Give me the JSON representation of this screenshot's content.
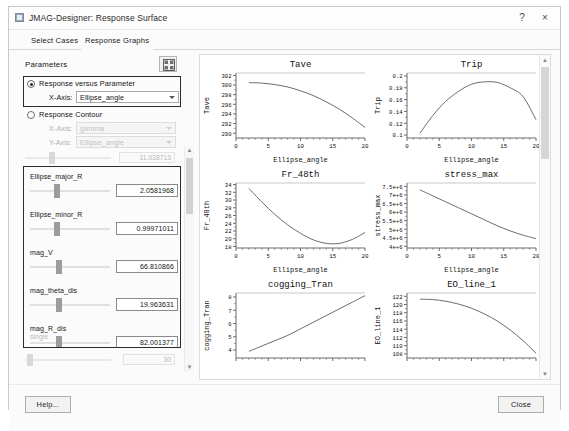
{
  "window": {
    "title": "JMAG-Designer: Response Surface",
    "help_button": "?",
    "close_button": "×"
  },
  "tabs": [
    {
      "label": "Select Cases",
      "active": false
    },
    {
      "label": "Response Graphs",
      "active": true
    }
  ],
  "left_panel": {
    "heading": "Parameters",
    "layout_button_icon": "grid-icon",
    "mode_options": [
      {
        "label": "Response versus Parameter",
        "selected": true,
        "axes": [
          {
            "label": "X-Axis:",
            "value": "Ellipse_angle",
            "enabled": true
          }
        ]
      },
      {
        "label": "Response Contour",
        "selected": false,
        "axes": [
          {
            "label": "X-Axis:",
            "value": "gamma",
            "enabled": false
          },
          {
            "label": "Y-Axis:",
            "value": "Ellipse_angle",
            "enabled": false
          }
        ]
      }
    ],
    "top_partial_slider": {
      "value": "11.038713",
      "enabled": false
    },
    "sliders": [
      {
        "name": "Ellipse_major_R",
        "value": "2.0581968",
        "thumb_pct": 30
      },
      {
        "name": "Ellipse_minor_R",
        "value": "0.99971011",
        "thumb_pct": 30
      },
      {
        "name": "mag_V",
        "value": "66.810866",
        "thumb_pct": 32
      },
      {
        "name": "mag_theta_dis",
        "value": "19.963631",
        "thumb_pct": 32
      },
      {
        "name": "mag_R_dis",
        "value": "82.001377",
        "thumb_pct": 32
      }
    ],
    "partial_slider_name": "single",
    "bottom_partial_slider": {
      "value": "30",
      "enabled": false
    },
    "scrollbar": {
      "up": "▲",
      "down": "▼"
    }
  },
  "chart_scrollbar": {
    "up": "▲",
    "down": "▼"
  },
  "footer": {
    "help_label": "Help...",
    "close_label": "Close"
  },
  "chart_data": [
    {
      "type": "line",
      "title": "Tave",
      "xlabel": "Ellipse_angle",
      "ylabel": "Tave",
      "xlim": [
        0,
        20
      ],
      "ylim": [
        289,
        302.5
      ],
      "xticks": [
        0,
        5,
        10,
        15,
        20
      ],
      "yticks": [
        290,
        292,
        294,
        296,
        298,
        300,
        302
      ],
      "grid": false,
      "x": [
        2,
        4,
        6,
        8,
        10,
        12,
        14,
        16,
        18,
        20
      ],
      "values": [
        300.5,
        300.4,
        300.1,
        299.6,
        298.8,
        297.8,
        296.5,
        295.0,
        293.2,
        291.2
      ]
    },
    {
      "type": "line",
      "title": "Trip",
      "xlabel": "Ellipse_angle",
      "ylabel": "Trip",
      "xlim": [
        0,
        20
      ],
      "ylim": [
        0.095,
        0.205
      ],
      "xticks": [
        0,
        5,
        10,
        15,
        20
      ],
      "yticks": [
        0.1,
        0.12,
        0.14,
        0.16,
        0.18,
        0.2
      ],
      "grid": false,
      "x": [
        2,
        4,
        6,
        8,
        10,
        12,
        14,
        16,
        18,
        20
      ],
      "values": [
        0.103,
        0.133,
        0.157,
        0.174,
        0.186,
        0.19,
        0.189,
        0.18,
        0.165,
        0.126
      ]
    },
    {
      "type": "line",
      "title": "Fr_48th",
      "xlabel": "Ellipse_angle",
      "ylabel": "Fr_48th",
      "xlim": [
        0,
        20
      ],
      "ylim": [
        17.6,
        34.4
      ],
      "xticks": [
        0,
        5,
        10,
        15,
        20
      ],
      "yticks": [
        18,
        20,
        22,
        24,
        26,
        28,
        30,
        32,
        34
      ],
      "grid": false,
      "x": [
        2,
        4,
        6,
        8,
        10,
        12,
        14,
        16,
        18,
        20
      ],
      "values": [
        33.0,
        29.5,
        26.3,
        23.6,
        21.4,
        19.7,
        18.8,
        18.8,
        19.8,
        21.6
      ]
    },
    {
      "type": "line",
      "title": "stress_max",
      "xlabel": "Ellipse_angle",
      "ylabel": "stress_max",
      "xlim": [
        0,
        20
      ],
      "ylim": [
        3900000,
        7700000
      ],
      "xticks": [
        0,
        5,
        10,
        15,
        20
      ],
      "yticks": [
        4000000,
        4500000,
        5000000,
        5500000,
        6000000,
        6500000,
        7000000,
        7500000
      ],
      "ytick_labels": [
        "4e+6",
        "4.5e+6",
        "5e+6",
        "5.5e+6",
        "6e+6",
        "6.5e+6",
        "7e+6",
        "7.5e+6"
      ],
      "grid": false,
      "x": [
        2,
        4,
        6,
        8,
        10,
        12,
        14,
        16,
        18,
        20
      ],
      "values": [
        7300000,
        6950000,
        6600000,
        6250000,
        5900000,
        5550000,
        5200000,
        4900000,
        4650000,
        4450000
      ]
    },
    {
      "type": "line",
      "title": "cogging_Tran",
      "xlabel": "Ellipse_angle",
      "ylabel": "cogging_Tran",
      "xlim": [
        0,
        20
      ],
      "ylim": [
        3.4,
        8.3
      ],
      "xticks": [
        0,
        5,
        10,
        15,
        20
      ],
      "yticks": [
        4,
        5,
        6,
        7,
        8
      ],
      "grid": false,
      "x": [
        2,
        4,
        6,
        8,
        10,
        12,
        14,
        16,
        18,
        20
      ],
      "values": [
        3.9,
        4.3,
        4.7,
        5.1,
        5.6,
        6.1,
        6.6,
        7.1,
        7.6,
        8.1
      ]
    },
    {
      "type": "line",
      "title": "EO_line_1",
      "xlabel": "Ellipse_angle",
      "ylabel": "EO_line_1",
      "xlim": [
        0,
        20
      ],
      "ylim": [
        107,
        122.8
      ],
      "xticks": [
        0,
        5,
        10,
        15,
        20
      ],
      "yticks": [
        108,
        110,
        112,
        114,
        116,
        118,
        120,
        122
      ],
      "grid": false,
      "x": [
        2,
        4,
        6,
        8,
        10,
        12,
        14,
        16,
        18,
        20
      ],
      "values": [
        121.3,
        121.2,
        120.8,
        120.1,
        119.1,
        117.7,
        116.0,
        113.8,
        111.2,
        108.2
      ]
    }
  ]
}
